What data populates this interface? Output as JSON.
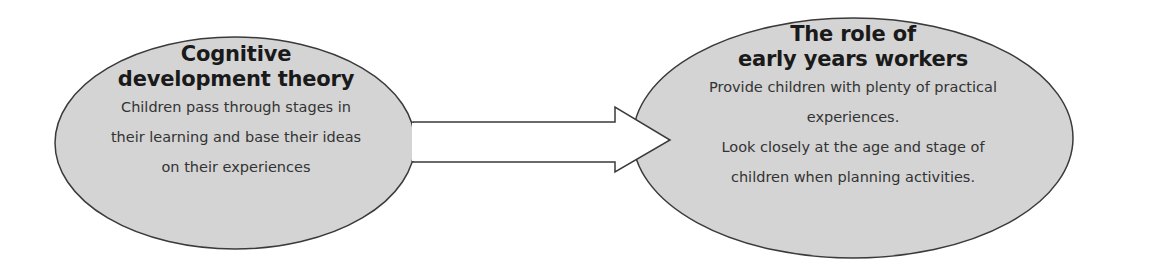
{
  "colors": {
    "ellipse_fill": "#d4d4d4",
    "ellipse_stroke": "#3a3a3a",
    "arrow_fill": "#ffffff",
    "arrow_stroke": "#3a3a3a",
    "text": "#2a2a2a",
    "background": "#ffffff"
  },
  "nodes": {
    "left": {
      "title_line1": "Cognitive",
      "title_line2": "development theory",
      "body_lines": [
        "Children pass through stages in",
        "their learning and base their ideas",
        "on their experiences"
      ]
    },
    "right": {
      "title_line1": "The role of",
      "title_line2": "early years workers",
      "body_lines": [
        "Provide children with plenty of practical",
        "experiences.",
        "Look closely at the age and stage of",
        "children when planning activities."
      ]
    }
  },
  "connector": {
    "type": "block-arrow",
    "from": "left",
    "to": "right"
  }
}
